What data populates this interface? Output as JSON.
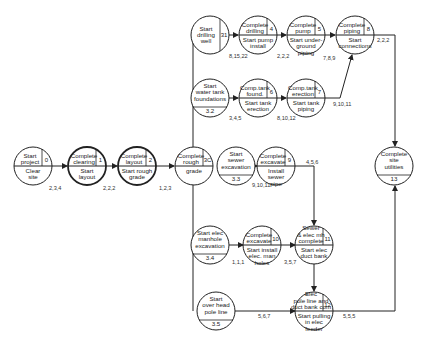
{
  "diagram": {
    "type": "PERT network",
    "nodes": [
      {
        "id": "n0",
        "top": [
          "Start",
          "project"
        ],
        "bottom": [
          "Clear",
          "site"
        ],
        "event": "0",
        "cx": 33,
        "cy": 166,
        "split": "cross"
      },
      {
        "id": "n1",
        "top": [
          "Complete",
          "clearing"
        ],
        "bottom": [
          "Start",
          "layout"
        ],
        "event": "1",
        "cx": 87,
        "cy": 166,
        "split": "cross",
        "bold": true
      },
      {
        "id": "n2",
        "top": [
          "Complete",
          "layout"
        ],
        "bottom": [
          "Start rough",
          "grade"
        ],
        "event": "2",
        "cx": 137,
        "cy": 166,
        "split": "cross",
        "bold": true
      },
      {
        "id": "n3",
        "top": [
          "Complete",
          "rough"
        ],
        "bottom": [
          "grade"
        ],
        "event": "3C",
        "cx": 194,
        "cy": 166,
        "split": "cross"
      },
      {
        "id": "n31",
        "top": [
          "Start",
          "drilling",
          "well"
        ],
        "bottom": [],
        "event": "31",
        "cx": 210,
        "cy": 35,
        "split": "vertical"
      },
      {
        "id": "n4",
        "top": [
          "Complete",
          "drilling"
        ],
        "bottom": [
          "Start pump",
          "install"
        ],
        "event": "4",
        "cx": 258,
        "cy": 35,
        "split": "cross"
      },
      {
        "id": "n5",
        "top": [
          "Complete",
          "pump"
        ],
        "bottom": [
          "Start under-",
          "ground",
          "piping"
        ],
        "event": "5",
        "cx": 306,
        "cy": 35,
        "split": "cross"
      },
      {
        "id": "n8",
        "top": [
          "Complete",
          "piping"
        ],
        "bottom": [
          "Start",
          "connections"
        ],
        "event": "8",
        "cx": 355,
        "cy": 35,
        "split": "cross"
      },
      {
        "id": "n32",
        "top": [
          "Start",
          "water tank",
          "foundations"
        ],
        "bottom": [
          "3.2"
        ],
        "event": "",
        "cx": 210,
        "cy": 98,
        "split": "horizontal"
      },
      {
        "id": "n6",
        "top": [
          "Comp.tank",
          "found."
        ],
        "bottom": [
          "Start tank",
          "erection"
        ],
        "event": "6",
        "cx": 258,
        "cy": 98,
        "split": "cross"
      },
      {
        "id": "n7",
        "top": [
          "Comp.tank",
          "erection"
        ],
        "bottom": [
          "Start tank",
          "piping"
        ],
        "event": "7",
        "cx": 306,
        "cy": 98,
        "split": "cross"
      },
      {
        "id": "n33",
        "top": [
          "Start",
          "sewer",
          "excavation"
        ],
        "bottom": [
          "3.3"
        ],
        "event": "",
        "cx": 236,
        "cy": 166,
        "split": "horizontal"
      },
      {
        "id": "n9",
        "top": [
          "Complete",
          "excavate"
        ],
        "bottom": [
          "Install",
          "sewer",
          "pipe"
        ],
        "event": "9",
        "cx": 276,
        "cy": 166,
        "split": "cross"
      },
      {
        "id": "n34",
        "top": [
          "Start elec",
          "manhole",
          "excavation"
        ],
        "bottom": [
          "3.4"
        ],
        "event": "",
        "cx": 210,
        "cy": 245,
        "split": "horizontal"
      },
      {
        "id": "n10",
        "top": [
          "Complete",
          "excavate"
        ],
        "bottom": [
          "Start install",
          "elec. man",
          "holes"
        ],
        "event": "10",
        "cx": 262,
        "cy": 245,
        "split": "cross"
      },
      {
        "id": "n11",
        "top": [
          "Sewer",
          "& elec mh",
          "complete"
        ],
        "bottom": [
          "Start elec",
          "duct bank"
        ],
        "event": "11",
        "cx": 314,
        "cy": 245,
        "split": "cross"
      },
      {
        "id": "n35",
        "top": [
          "Start",
          "over head",
          "pole line"
        ],
        "bottom": [
          "3.5"
        ],
        "event": "",
        "cx": 216,
        "cy": 311,
        "split": "horizontal"
      },
      {
        "id": "n12",
        "top": [
          "Elec",
          "pole line and",
          "duct bank com"
        ],
        "bottom": [
          "Start pulling",
          "in elec",
          "feeder"
        ],
        "event": "12",
        "cx": 314,
        "cy": 311,
        "split": "cross"
      },
      {
        "id": "n13",
        "top": [
          "Complete",
          "site",
          "utilities"
        ],
        "bottom": [
          "13"
        ],
        "event": "",
        "cx": 394,
        "cy": 166,
        "split": "horizontal"
      }
    ],
    "edges": [
      {
        "from": "n0",
        "to": "n1",
        "label": "2,3,4"
      },
      {
        "from": "n1",
        "to": "n2",
        "label": "2,2,2"
      },
      {
        "from": "n2",
        "to": "n3",
        "label": "1,2,3"
      },
      {
        "from": "n31",
        "to": "n4",
        "label": "8,15,22"
      },
      {
        "from": "n4",
        "to": "n5",
        "label": "2,2,2"
      },
      {
        "from": "n5",
        "to": "n8",
        "label": "7,8,9"
      },
      {
        "from": "n8",
        "to": "n13",
        "label": "2,2,2"
      },
      {
        "from": "n32",
        "to": "n6",
        "label": "3,4,5"
      },
      {
        "from": "n6",
        "to": "n7",
        "label": "8,10,12"
      },
      {
        "from": "n7",
        "to": "n8",
        "label": "9,10,11"
      },
      {
        "from": "n33",
        "to": "n9",
        "label": "9,10,11"
      },
      {
        "from": "n9",
        "to": "n11",
        "label": "4,5,6"
      },
      {
        "from": "n34",
        "to": "n10",
        "label": "1,1,1"
      },
      {
        "from": "n10",
        "to": "n11",
        "label": "3,5,7"
      },
      {
        "from": "n11",
        "to": "n12",
        "label": ""
      },
      {
        "from": "n35",
        "to": "n12",
        "label": "5,6,7"
      },
      {
        "from": "n12",
        "to": "n13",
        "label": "5,5,5"
      }
    ]
  },
  "labels": {
    "e_0_1": "2,3,4",
    "e_1_2": "2,2,2",
    "e_2_3": "1,2,3",
    "e_31_4": "8,15,22",
    "e_4_5": "2,2,2",
    "e_5_8": "7,8,9",
    "e_8_13": "2,2,2",
    "e_32_6": "3,4,5",
    "e_6_7": "8,10,12",
    "e_7_8": "9,10,11",
    "e_33_9": "9,10,11",
    "e_9_11": "4,5,6",
    "e_34_10": "1,1,1",
    "e_10_11": "3,5,7",
    "e_35_12": "5,6,7",
    "e_12_13": "5,5,5"
  }
}
